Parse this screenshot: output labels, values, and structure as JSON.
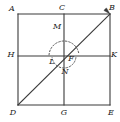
{
  "figure": {
    "type": "geometry-diagram",
    "canvas": {
      "width": 120,
      "height": 122
    },
    "colors": {
      "background": "#ffffff",
      "stroke": "#3a3a3a",
      "arc_stroke": "#5a5a5a",
      "label": "#1a1a1a"
    },
    "stroke_width": 1.1,
    "points": [
      {
        "name": "A",
        "label": "A",
        "x": 18,
        "y": 14,
        "label_x": 12,
        "label_y": 9,
        "role": "square-corner-top-left"
      },
      {
        "name": "C",
        "label": "C",
        "x": 64,
        "y": 14,
        "label_x": 62,
        "label_y": 8,
        "role": "top-edge-midpoint"
      },
      {
        "name": "B",
        "label": "B",
        "x": 110,
        "y": 14,
        "label_x": 112,
        "label_y": 8,
        "role": "square-corner-top-right"
      },
      {
        "name": "H",
        "label": "H",
        "x": 18,
        "y": 56,
        "label_x": 11,
        "label_y": 55,
        "role": "left-edge-midpoint"
      },
      {
        "name": "K",
        "label": "K",
        "x": 110,
        "y": 56,
        "label_x": 114,
        "label_y": 55,
        "role": "right-edge-midpoint"
      },
      {
        "name": "D",
        "label": "D",
        "x": 18,
        "y": 105,
        "label_x": 13,
        "label_y": 113,
        "role": "square-corner-bottom-left"
      },
      {
        "name": "G",
        "label": "G",
        "x": 64,
        "y": 105,
        "label_x": 64,
        "label_y": 113,
        "role": "bottom-edge-midpoint"
      },
      {
        "name": "E",
        "label": "E",
        "x": 110,
        "y": 105,
        "label_x": 111,
        "label_y": 113,
        "role": "square-corner-bottom-right"
      },
      {
        "name": "F",
        "label": "F",
        "x": 64,
        "y": 56,
        "label_x": 71,
        "label_y": 59,
        "role": "center-intersection"
      },
      {
        "name": "M",
        "label": "M",
        "x": 58,
        "y": 31,
        "label_x": 57,
        "label_y": 27,
        "role": "arc-point-upper"
      },
      {
        "name": "L",
        "label": "L",
        "x": 50,
        "y": 56,
        "label_x": 52,
        "label_y": 62,
        "role": "arc-point-left"
      },
      {
        "name": "N",
        "label": "N",
        "x": 64,
        "y": 68,
        "label_x": 65,
        "label_y": 72,
        "role": "arc-point-lower"
      }
    ],
    "segments": [
      {
        "name": "AB",
        "from": "A",
        "to": "B",
        "style": "solid",
        "role": "square-top-edge"
      },
      {
        "name": "BE",
        "from": "B",
        "to": "E",
        "style": "solid",
        "role": "square-right-edge"
      },
      {
        "name": "ED",
        "from": "E",
        "to": "D",
        "style": "solid",
        "role": "square-bottom-edge"
      },
      {
        "name": "DA",
        "from": "D",
        "to": "A",
        "style": "solid",
        "role": "square-left-edge"
      },
      {
        "name": "CG",
        "from": "C",
        "to": "G",
        "style": "solid",
        "role": "vertical-midline"
      },
      {
        "name": "HK",
        "from": "H",
        "to": "K",
        "style": "solid",
        "role": "horizontal-midline"
      },
      {
        "name": "DB",
        "from": "D",
        "to": "B",
        "style": "solid",
        "role": "diagonal-with-arrow"
      }
    ],
    "arcs": [
      {
        "name": "arc-large",
        "center_x": 64,
        "center_y": 56,
        "radius": 15,
        "start_angle_deg": 176,
        "end_angle_deg": 8,
        "style": "dashed",
        "role": "major-construction-arc-through-M"
      },
      {
        "name": "arc-small",
        "center_x": 64,
        "center_y": 56,
        "radius": 12,
        "start_angle_deg": 352,
        "end_angle_deg": 188,
        "style": "dashed",
        "role": "minor-construction-arc-through-N-and-F"
      }
    ],
    "arrow": {
      "name": "diagonal-arrowhead",
      "at": "B",
      "direction_deg": -45,
      "length": 7,
      "role": "arrowhead-at-B"
    }
  }
}
